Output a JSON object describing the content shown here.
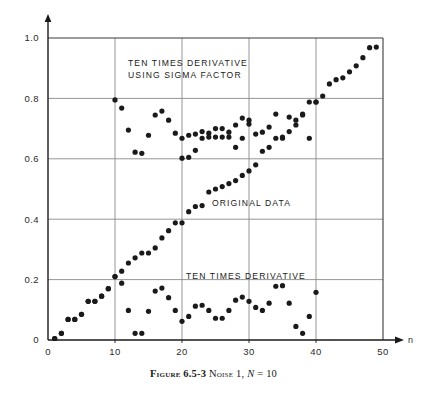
{
  "caption": {
    "figure_word": "Figure",
    "figure_number": "6.5-3",
    "noise_word": "Noise",
    "noise_number": "1,",
    "n_symbol": "N",
    "equals": "=",
    "n_value": "10"
  },
  "annotations": {
    "sigma_line1": "TEN TIMES DERIVATIVE",
    "sigma_line2": "USING SIGMA FACTOR",
    "original": "ORIGINAL DATA",
    "derivative": "TEN TIMES DERIVATIVE"
  },
  "colors": {
    "ink": "#1a1a1a",
    "grid": "#8a8a8a",
    "frame": "#3a3a3a",
    "background": "#ffffff"
  },
  "chart_data": {
    "type": "scatter",
    "title": "",
    "xlabel": "n",
    "ylabel": "",
    "xlim": [
      0,
      50
    ],
    "ylim": [
      0,
      1.0
    ],
    "xticks": [
      0,
      10,
      20,
      30,
      40,
      50
    ],
    "xtick_labels": [
      "0",
      "10",
      "20",
      "30",
      "40",
      "50"
    ],
    "yticks": [
      0,
      0.2,
      0.4,
      0.6,
      0.8,
      1.0
    ],
    "ytick_labels": [
      "0",
      "0.2",
      "0.4",
      "0.6",
      "0.8",
      "1.0"
    ],
    "grid": true,
    "grid_axis": "both",
    "legend": "none",
    "marker": "filled-circle",
    "marker_size": 2.6,
    "series": [
      {
        "name": "ORIGINAL DATA",
        "points": [
          [
            1,
            0.005
          ],
          [
            2,
            0.022
          ],
          [
            3,
            0.068
          ],
          [
            4,
            0.068
          ],
          [
            5,
            0.085
          ],
          [
            6,
            0.128
          ],
          [
            7,
            0.128
          ],
          [
            8,
            0.145
          ],
          [
            9,
            0.17
          ],
          [
            10,
            0.21
          ],
          [
            11,
            0.228
          ],
          [
            12,
            0.255
          ],
          [
            13,
            0.272
          ],
          [
            14,
            0.288
          ],
          [
            15,
            0.288
          ],
          [
            16,
            0.305
          ],
          [
            17,
            0.338
          ],
          [
            18,
            0.362
          ],
          [
            19,
            0.388
          ],
          [
            20,
            0.388
          ],
          [
            21,
            0.425
          ],
          [
            22,
            0.442
          ],
          [
            23,
            0.445
          ],
          [
            24,
            0.49
          ],
          [
            25,
            0.5
          ],
          [
            26,
            0.508
          ],
          [
            27,
            0.518
          ],
          [
            28,
            0.528
          ],
          [
            29,
            0.545
          ],
          [
            30,
            0.56
          ],
          [
            31,
            0.58
          ],
          [
            32,
            0.625
          ],
          [
            33,
            0.638
          ],
          [
            34,
            0.668
          ],
          [
            35,
            0.668
          ],
          [
            36,
            0.69
          ],
          [
            37,
            0.728
          ],
          [
            38,
            0.748
          ],
          [
            39,
            0.788
          ],
          [
            40,
            0.788
          ],
          [
            41,
            0.808
          ],
          [
            42,
            0.848
          ],
          [
            43,
            0.862
          ],
          [
            44,
            0.868
          ],
          [
            45,
            0.888
          ],
          [
            46,
            0.908
          ],
          [
            47,
            0.935
          ],
          [
            48,
            0.968
          ],
          [
            49,
            0.97
          ]
        ]
      },
      {
        "name": "TEN TIMES DERIVATIVE",
        "points": [
          [
            1,
            0.005
          ],
          [
            2,
            0.022
          ],
          [
            3,
            0.068
          ],
          [
            4,
            0.068
          ],
          [
            5,
            0.085
          ],
          [
            6,
            0.128
          ],
          [
            7,
            0.128
          ],
          [
            8,
            0.145
          ],
          [
            9,
            0.17
          ],
          [
            10,
            0.21
          ],
          [
            11,
            0.188
          ],
          [
            12,
            0.098
          ],
          [
            13,
            0.022
          ],
          [
            14,
            0.022
          ],
          [
            15,
            0.095
          ],
          [
            16,
            0.162
          ],
          [
            17,
            0.172
          ],
          [
            18,
            0.14
          ],
          [
            19,
            0.098
          ],
          [
            20,
            0.062
          ],
          [
            21,
            0.078
          ],
          [
            22,
            0.112
          ],
          [
            23,
            0.115
          ],
          [
            24,
            0.098
          ],
          [
            25,
            0.072
          ],
          [
            26,
            0.072
          ],
          [
            27,
            0.098
          ],
          [
            28,
            0.132
          ],
          [
            29,
            0.142
          ],
          [
            30,
            0.128
          ],
          [
            31,
            0.108
          ],
          [
            32,
            0.098
          ],
          [
            33,
            0.122
          ],
          [
            34,
            0.178
          ],
          [
            35,
            0.18
          ],
          [
            36,
            0.122
          ],
          [
            37,
            0.045
          ],
          [
            38,
            0.022
          ],
          [
            39,
            0.078
          ],
          [
            40,
            0.158
          ]
        ]
      },
      {
        "name": "TEN TIMES DERIVATIVE USING SIGMA FACTOR",
        "points": [
          [
            10,
            0.795
          ],
          [
            11,
            0.768
          ],
          [
            12,
            0.695
          ],
          [
            13,
            0.622
          ],
          [
            14,
            0.618
          ],
          [
            15,
            0.678
          ],
          [
            16,
            0.745
          ],
          [
            17,
            0.758
          ],
          [
            18,
            0.728
          ],
          [
            19,
            0.685
          ],
          [
            20,
            0.668
          ],
          [
            21,
            0.678
          ],
          [
            22,
            0.682
          ],
          [
            23,
            0.69
          ],
          [
            24,
            0.685
          ],
          [
            25,
            0.672
          ],
          [
            26,
            0.672
          ],
          [
            27,
            0.688
          ],
          [
            28,
            0.712
          ],
          [
            29,
            0.735
          ],
          [
            30,
            0.715
          ],
          [
            31,
            0.682
          ],
          [
            32,
            0.688
          ],
          [
            33,
            0.705
          ],
          [
            34,
            0.748
          ],
          [
            35,
            0.672
          ],
          [
            36,
            0.738
          ],
          [
            37,
            0.712
          ],
          [
            38,
            0.745
          ],
          [
            39,
            0.668
          ],
          [
            40,
            0.788
          ]
        ]
      },
      {
        "name": "TEN TIMES DERIVATIVE USING SIGMA FACTOR (lower tail)",
        "points": [
          [
            20,
            0.602
          ],
          [
            21,
            0.605
          ],
          [
            22,
            0.628
          ],
          [
            23,
            0.668
          ],
          [
            24,
            0.672
          ],
          [
            25,
            0.7
          ],
          [
            26,
            0.7
          ],
          [
            27,
            0.672
          ],
          [
            28,
            0.638
          ],
          [
            29,
            0.668
          ],
          [
            30,
            0.728
          ]
        ]
      }
    ]
  }
}
